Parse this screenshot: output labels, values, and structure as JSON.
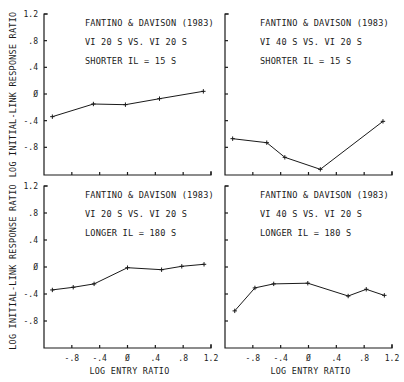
{
  "chart_data": [
    {
      "type": "line",
      "panel": "top-left",
      "annotation": [
        "FANTINO & DAVISON (1983)",
        "VI 20 S VS. VI 20 S",
        "SHORTER IL = 15 S"
      ],
      "xlabel": "",
      "ylabel": "LOG INITIAL-LINK RESPONSE RATIO",
      "xlim": [
        -1.2,
        1.2
      ],
      "ylim": [
        -1.2,
        1.2
      ],
      "yticks": [
        "1.2",
        ".8",
        ".4",
        "0",
        "-.4",
        "-.8"
      ],
      "xticks": [],
      "grid": false,
      "x": [
        -1.08,
        -0.49,
        -0.03,
        0.46,
        1.09
      ],
      "y": [
        -0.34,
        -0.15,
        -0.16,
        -0.07,
        0.04
      ]
    },
    {
      "type": "line",
      "panel": "top-right",
      "annotation": [
        "FANTINO & DAVISON (1983)",
        "VI 40 S VS. VI 20 S",
        "SHORTER IL = 15 S"
      ],
      "xlabel": "",
      "ylabel": "",
      "xlim": [
        -1.2,
        1.2
      ],
      "ylim": [
        -1.2,
        1.2
      ],
      "yticks": [],
      "xticks": [],
      "grid": false,
      "x": [
        -1.09,
        -0.6,
        -0.34,
        0.17,
        1.07
      ],
      "y": [
        -0.67,
        -0.73,
        -0.95,
        -1.13,
        -0.41
      ]
    },
    {
      "type": "line",
      "panel": "bottom-left",
      "annotation": [
        "FANTINO & DAVISON (1983)",
        "VI 20 S VS. VI 20 S",
        "LONGER IL = 180 S"
      ],
      "xlabel": "LOG ENTRY RATIO",
      "ylabel": "LOG INITIAL-LINK RESPONSE RATIO",
      "xlim": [
        -1.2,
        1.2
      ],
      "ylim": [
        -1.2,
        1.2
      ],
      "yticks": [
        "1.2",
        ".8",
        ".4",
        "0",
        "-.4",
        "-.8"
      ],
      "xticks": [
        "-.8",
        "-.4",
        "0",
        ".4",
        ".8",
        "1.2"
      ],
      "grid": false,
      "x": [
        -1.08,
        -0.78,
        -0.48,
        0.0,
        0.49,
        0.78,
        1.1
      ],
      "y": [
        -0.34,
        -0.3,
        -0.25,
        -0.01,
        -0.04,
        0.01,
        0.04
      ]
    },
    {
      "type": "line",
      "panel": "bottom-right",
      "annotation": [
        "FANTINO & DAVISON (1983)",
        "VI 40 S VS. VI 20 S",
        "LONGER IL = 180 S"
      ],
      "xlabel": "LOG ENTRY RATIO",
      "ylabel": "",
      "xlim": [
        -1.2,
        1.2
      ],
      "ylim": [
        -1.2,
        1.2
      ],
      "yticks": [],
      "xticks": [
        "-.8",
        "-.4",
        "0",
        ".4",
        ".8",
        "1.2"
      ],
      "grid": false,
      "x": [
        -1.06,
        -0.77,
        -0.5,
        -0.01,
        0.57,
        0.83,
        1.09
      ],
      "y": [
        -0.65,
        -0.31,
        -0.25,
        -0.24,
        -0.43,
        -0.33,
        -0.42
      ]
    }
  ],
  "figure": {
    "ylabel": "LOG INITIAL-LINK RESPONSE RATIO",
    "xlabel": "LOG ENTRY RATIO",
    "tick_values": [
      -0.8,
      -0.4,
      0,
      0.4,
      0.8,
      1.2
    ],
    "line_color": "#1a1a1a",
    "background": "#ffffff"
  }
}
